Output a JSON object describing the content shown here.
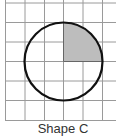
{
  "figure": {
    "caption": "Shape C",
    "grid": {
      "cols": 6,
      "rows": 6,
      "cell_px": 19.4,
      "line_color": "#9a9a9a"
    },
    "circle": {
      "center_cell": [
        3,
        3
      ],
      "radius_cells": 2,
      "stroke": "#111111"
    },
    "shaded_region": {
      "quadrant": "top-right",
      "fill": "#bdbdbd"
    }
  }
}
